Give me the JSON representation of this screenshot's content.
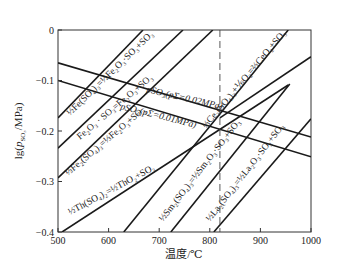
{
  "chart_data": {
    "type": "line",
    "title": "",
    "xlabel": "温度/℃",
    "ylabel": "lg(pSO3/MPa)",
    "xlim": [
      500,
      1000
    ],
    "ylim": [
      -0.4,
      0
    ],
    "xticks": [
      500,
      600,
      700,
      800,
      900,
      1000
    ],
    "yticks": [
      0,
      -0.1,
      -0.2,
      -0.3,
      -0.4
    ],
    "ytick_labels": [
      "0",
      "−0.1",
      "−0.2",
      "−0.3",
      "−0.4"
    ],
    "grid": false,
    "legend": "none (inline labels)",
    "reference_lines": [
      {
        "type": "vertical",
        "x": 820,
        "style": "dashed"
      }
    ],
    "series": [
      {
        "name": "1/2 Fe(SO4)3 = 1/2 Fe2O3·SO3 + SO3",
        "x": [
          500,
          668
        ],
        "y": [
          -0.174,
          0
        ]
      },
      {
        "name": "Fe2O3·SO3 = Fe2O3 + SO3",
        "x": [
          500,
          747
        ],
        "y": [
          -0.234,
          0
        ]
      },
      {
        "name": "1/3 Fe2(SO4)3 = 1/3 Fe2O3 + SO3",
        "x": [
          500,
          806
        ],
        "y": [
          -0.293,
          0
        ]
      },
      {
        "name": "1/2 Th(SO4)2 = 1/2 ThO2 + SO3",
        "x": [
          508,
          955
        ],
        "y": [
          -0.4,
          -0.109
        ]
      },
      {
        "name": "1/3 Ce2(SO4)3 + 1/6 O2 = 2/3 CeO2 + SO3",
        "x": [
          630,
          955
        ],
        "y": [
          -0.4,
          0
        ]
      },
      {
        "name": "1/2 Sm2(SO4)3 = 1/2 Sm2O3·SO3 + SO3",
        "x": [
          723,
          958
        ],
        "y": [
          -0.4,
          -0.107
        ]
      },
      {
        "name": "1/2 La2(SO4)3 = 1/2 La2O3·SO3 + SO3",
        "x": [
          808,
          1000
        ],
        "y": [
          -0.4,
          -0.176
        ]
      },
      {
        "name": "pSO3 (pΣ = 0.02MPa)",
        "x": [
          500,
          1000
        ],
        "y": [
          -0.065,
          -0.212
        ]
      },
      {
        "name": "pSO3 (pΣ = 0.01MPa)",
        "x": [
          500,
          1000
        ],
        "y": [
          -0.1,
          -0.251
        ]
      },
      {
        "name": "Ce branch",
        "x": [
          820,
          1000
        ],
        "y": [
          -0.174,
          -0.053
        ]
      }
    ],
    "annotations": [
      "1/2 Fe(SO4)3 = 1/2 Fe2O3·SO3 + SO3",
      "Fe2O3·SO3 = Fe2O3 + SO3",
      "1/3 Fe2(SO4)3 = 1/3 Fe2O3 + SO3",
      "pSO3(pΣ=0.02MPa)",
      "pSO3(pΣ=0.01MPa)",
      "1/3 Ce2(SO4)3 + 1/6 O2 = 2/3 CeO2 + SO3",
      "1/2 Th(SO4)2 = 1/2 ThO2 + SO3",
      "1/2 Sm2(SO4)3 = 1/2 Sm2O3·SO3 + SO3",
      "1/2 La2(SO4)3 = 1/2 La2O3·SO3 + SO3"
    ]
  },
  "labels": {
    "fe1": "½Fe(SO₄)₃=½Fe₂O₃·SO₃+SO₃",
    "fe2": "Fe₂O₃ · SO₃=Fe₂O₃+SO₃",
    "fe3": "⅓Fe₂(SO₄)₃=⅓Fe₂O₃+SO₃",
    "p02": "pSO₃(pΣ=0.02MPa)",
    "p01": "pSO₃(pΣ=0.01MPa)",
    "ce": "⅓Ce₂(SO₄)₃+⅙O₂=⅔CeO₂+SO₃",
    "th": "½Th(SO₄)₂=½ThO₂+SO₃",
    "sm": "½Sm₂(SO₄)₃=½Sm₂O₃·SO₃+SO₃",
    "la": "½La₂(SO₄)₃=½La₂O₃·SO₃+SO₃"
  }
}
